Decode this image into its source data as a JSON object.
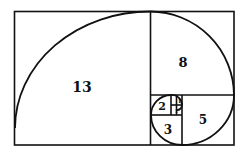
{
  "diagram": {
    "squares": [
      {
        "label": "13"
      },
      {
        "label": "8"
      },
      {
        "label": "5"
      },
      {
        "label": "3"
      },
      {
        "label": "2"
      },
      {
        "label": "1"
      },
      {
        "label": "1"
      }
    ],
    "colors": {
      "stroke": "#111111",
      "background": "#ffffff"
    }
  }
}
